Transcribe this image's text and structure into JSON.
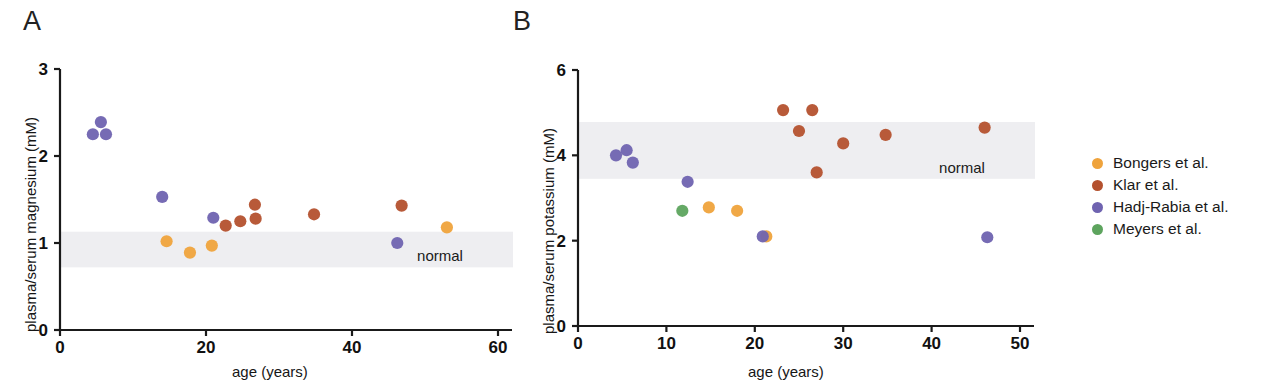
{
  "figure": {
    "panels": [
      {
        "id": "A",
        "label": "A"
      },
      {
        "id": "B",
        "label": "B"
      }
    ],
    "legend": {
      "items": [
        {
          "label": "Bongers et al.",
          "color": "#efa33c"
        },
        {
          "label": "Klar et al.",
          "color": "#b4512e"
        },
        {
          "label": "Hadj-Rabia et al.",
          "color": "#6f63b0"
        },
        {
          "label": "Meyers et al.",
          "color": "#5da45e"
        }
      ]
    }
  },
  "chart_data": [
    {
      "panel": "A",
      "type": "scatter",
      "title": "",
      "xlabel": "age (years)",
      "ylabel": "plasma/serum magnesium (mM)",
      "xlim": [
        0,
        60
      ],
      "ylim": [
        0,
        3
      ],
      "xticks": [
        0,
        20,
        40,
        60
      ],
      "xtick_labels": [
        "0",
        "20",
        "40",
        "60"
      ],
      "yticks": [
        0,
        1,
        2,
        3
      ],
      "ytick_labels": [
        "0",
        "1",
        "2",
        "3"
      ],
      "grid": false,
      "annotations": [
        {
          "type": "band",
          "label": "normal",
          "orientation": "horizontal",
          "y_range": [
            0.72,
            1.13
          ],
          "color": "#eeeef1"
        }
      ],
      "series": [
        {
          "name": "Bongers et al.",
          "color": "#efa33c",
          "points": [
            {
              "x": 14.6,
              "y": 1.02
            },
            {
              "x": 17.8,
              "y": 0.89
            },
            {
              "x": 20.8,
              "y": 0.97
            },
            {
              "x": 53.0,
              "y": 1.18
            }
          ]
        },
        {
          "name": "Klar et al.",
          "color": "#b4512e",
          "points": [
            {
              "x": 22.7,
              "y": 1.2
            },
            {
              "x": 24.7,
              "y": 1.25
            },
            {
              "x": 26.7,
              "y": 1.44
            },
            {
              "x": 26.8,
              "y": 1.28
            },
            {
              "x": 34.8,
              "y": 1.33
            },
            {
              "x": 46.8,
              "y": 1.43
            }
          ]
        },
        {
          "name": "Hadj-Rabia et al.",
          "color": "#6f63b0",
          "points": [
            {
              "x": 4.5,
              "y": 2.25
            },
            {
              "x": 5.6,
              "y": 2.39
            },
            {
              "x": 6.3,
              "y": 2.25
            },
            {
              "x": 14.0,
              "y": 1.53
            },
            {
              "x": 21.0,
              "y": 1.29
            },
            {
              "x": 46.2,
              "y": 1.0
            }
          ]
        }
      ]
    },
    {
      "panel": "B",
      "type": "scatter",
      "title": "",
      "xlabel": "age (years)",
      "ylabel": "plasma/serum potassium (mM)",
      "xlim": [
        0,
        50
      ],
      "ylim": [
        0,
        6
      ],
      "xticks": [
        0,
        10,
        20,
        30,
        40,
        50
      ],
      "xtick_labels": [
        "0",
        "10",
        "20",
        "30",
        "40",
        "50"
      ],
      "yticks": [
        0,
        2,
        4,
        6
      ],
      "ytick_labels": [
        "0",
        "2",
        "4",
        "6"
      ],
      "grid": false,
      "annotations": [
        {
          "type": "band",
          "label": "normal",
          "orientation": "horizontal",
          "y_range": [
            3.45,
            4.78
          ],
          "color": "#eeeef1"
        }
      ],
      "series": [
        {
          "name": "Bongers et al.",
          "color": "#efa33c",
          "points": [
            {
              "x": 14.8,
              "y": 2.78
            },
            {
              "x": 18.0,
              "y": 2.7
            },
            {
              "x": 21.3,
              "y": 2.1
            }
          ]
        },
        {
          "name": "Klar et al.",
          "color": "#b4512e",
          "points": [
            {
              "x": 23.2,
              "y": 5.06
            },
            {
              "x": 25.0,
              "y": 4.57
            },
            {
              "x": 26.5,
              "y": 5.06
            },
            {
              "x": 27.0,
              "y": 3.6
            },
            {
              "x": 30.0,
              "y": 4.28
            },
            {
              "x": 34.8,
              "y": 4.48
            },
            {
              "x": 46.0,
              "y": 4.65
            }
          ]
        },
        {
          "name": "Hadj-Rabia et al.",
          "color": "#6f63b0",
          "points": [
            {
              "x": 4.3,
              "y": 4.0
            },
            {
              "x": 5.5,
              "y": 4.12
            },
            {
              "x": 6.2,
              "y": 3.83
            },
            {
              "x": 12.4,
              "y": 3.38
            },
            {
              "x": 20.9,
              "y": 2.1
            },
            {
              "x": 46.3,
              "y": 2.08
            }
          ]
        },
        {
          "name": "Meyers et al.",
          "color": "#5da45e",
          "points": [
            {
              "x": 11.8,
              "y": 2.7
            }
          ]
        }
      ]
    }
  ]
}
